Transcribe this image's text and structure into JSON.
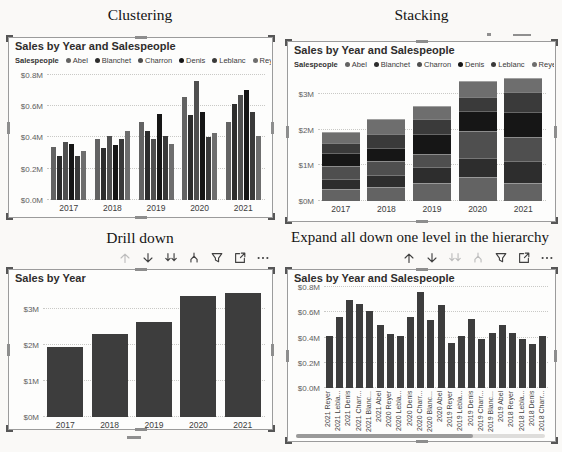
{
  "panels": {
    "clustering": {
      "heading": "Clustering",
      "visual_title": "Sales by Year and Salespeople",
      "legend_label": "Salespeople"
    },
    "stacking": {
      "heading": "Stacking",
      "visual_title": "Sales by Year and Salespeople",
      "legend_label": "Salespeople"
    },
    "drill": {
      "heading": "Drill down",
      "visual_title": "Sales by Year"
    },
    "expand": {
      "heading": "Expand all down one level in the hierarchy",
      "visual_title": "Sales by Year and Salespeople"
    }
  },
  "colors": {
    "bar_single": "#3d3d3d",
    "enabled_icon": "#404040",
    "disabled_icon": "#bdbdbd",
    "salespeople": {
      "Abel": "#636363",
      "Blanchet": "#2d2d2d",
      "Charron": "#4f4f4f",
      "Denis": "#161616",
      "Leblanc": "#3a3a3a",
      "Reyer": "#6e6e6e"
    }
  },
  "toolbars": {
    "drill": {
      "icons": [
        {
          "name": "drill-up",
          "enabled": false
        },
        {
          "name": "drill-down",
          "enabled": true
        },
        {
          "name": "go-to-next-level",
          "enabled": true
        },
        {
          "name": "expand-all-down",
          "enabled": true
        },
        {
          "name": "filter",
          "enabled": true
        },
        {
          "name": "focus-mode",
          "enabled": true
        },
        {
          "name": "more-options",
          "enabled": true
        }
      ]
    },
    "expand": {
      "icons": [
        {
          "name": "drill-up",
          "enabled": true
        },
        {
          "name": "drill-down",
          "enabled": true
        },
        {
          "name": "go-to-next-level",
          "enabled": false
        },
        {
          "name": "expand-all-down",
          "enabled": false
        },
        {
          "name": "filter",
          "enabled": true
        },
        {
          "name": "focus-mode",
          "enabled": true
        },
        {
          "name": "more-options",
          "enabled": true
        }
      ]
    }
  },
  "chart_data": [
    {
      "id": "clustering",
      "type": "bar",
      "subtype": "clustered",
      "title": "Sales by Year and Salespeople",
      "categories": [
        "2017",
        "2018",
        "2019",
        "2020",
        "2021"
      ],
      "series": [
        {
          "name": "Abel",
          "values": [
            0.34,
            0.39,
            0.5,
            0.66,
            0.5
          ]
        },
        {
          "name": "Blanchet",
          "values": [
            0.28,
            0.33,
            0.44,
            0.54,
            0.61
          ]
        },
        {
          "name": "Charron",
          "values": [
            0.37,
            0.41,
            0.39,
            0.76,
            0.67
          ]
        },
        {
          "name": "Denis",
          "values": [
            0.36,
            0.35,
            0.55,
            0.56,
            0.7
          ]
        },
        {
          "name": "Leblanc",
          "values": [
            0.28,
            0.39,
            0.41,
            0.4,
            0.56
          ]
        },
        {
          "name": "Reyer",
          "values": [
            0.31,
            0.44,
            0.36,
            0.43,
            0.41
          ]
        }
      ],
      "ytick_values": [
        0,
        0.2,
        0.4,
        0.6,
        0.8
      ],
      "ytick_labels": [
        "$0.0M",
        "$0.2M",
        "$0.4M",
        "$0.6M",
        "$0.8M"
      ],
      "ylim": [
        0,
        0.83
      ],
      "grid": true,
      "legend_position": "top"
    },
    {
      "id": "stacking",
      "type": "bar",
      "subtype": "stacked",
      "title": "Sales by Year and Salespeople",
      "categories": [
        "2017",
        "2018",
        "2019",
        "2020",
        "2021"
      ],
      "series": [
        {
          "name": "Abel",
          "values": [
            0.34,
            0.39,
            0.5,
            0.66,
            0.5
          ]
        },
        {
          "name": "Blanchet",
          "values": [
            0.28,
            0.33,
            0.44,
            0.54,
            0.61
          ]
        },
        {
          "name": "Charron",
          "values": [
            0.37,
            0.41,
            0.39,
            0.76,
            0.67
          ]
        },
        {
          "name": "Denis",
          "values": [
            0.36,
            0.35,
            0.55,
            0.56,
            0.7
          ]
        },
        {
          "name": "Leblanc",
          "values": [
            0.28,
            0.39,
            0.41,
            0.4,
            0.56
          ]
        },
        {
          "name": "Reyer",
          "values": [
            0.31,
            0.44,
            0.36,
            0.43,
            0.41
          ]
        }
      ],
      "totals": [
        1.94,
        2.31,
        2.65,
        3.35,
        3.45
      ],
      "ytick_values": [
        0,
        1,
        2,
        3
      ],
      "ytick_labels": [
        "$0M",
        "$1M",
        "$2M",
        "$3M"
      ],
      "ylim": [
        0,
        3.5
      ],
      "grid": true,
      "legend_position": "top"
    },
    {
      "id": "drill",
      "type": "bar",
      "subtype": "simple",
      "title": "Sales by Year",
      "categories": [
        "2017",
        "2018",
        "2019",
        "2020",
        "2021"
      ],
      "values": [
        1.94,
        2.31,
        2.65,
        3.35,
        3.45
      ],
      "ytick_values": [
        0,
        1,
        2,
        3
      ],
      "ytick_labels": [
        "$0M",
        "$1M",
        "$2M",
        "$3M"
      ],
      "ylim": [
        0,
        3.5
      ],
      "grid": true
    },
    {
      "id": "expand",
      "type": "bar",
      "subtype": "simple",
      "title": "Sales by Year and Salespeople",
      "categories": [
        "2021 Reyer",
        "2021 Lebla...",
        "2021 Denis",
        "2021 Charr...",
        "2021 Blanc...",
        "2021 Abel",
        "2020 Reyer",
        "2020 Lebla...",
        "2020 Denis",
        "2020 Charr...",
        "2020 Blanc...",
        "2020 Abel",
        "2019 Reyer",
        "2019 Lebla...",
        "2019 Denis",
        "2019 Charr...",
        "2019 Blanc...",
        "2019 Abel",
        "2018 Reyer",
        "2018 Lebla...",
        "2018 Denis",
        "2018 Charr..."
      ],
      "values": [
        0.41,
        0.56,
        0.7,
        0.67,
        0.61,
        0.5,
        0.43,
        0.41,
        0.56,
        0.76,
        0.54,
        0.66,
        0.36,
        0.41,
        0.55,
        0.39,
        0.44,
        0.5,
        0.44,
        0.39,
        0.35,
        0.41
      ],
      "ytick_values": [
        0,
        0.2,
        0.4,
        0.6,
        0.8
      ],
      "ytick_labels": [
        "$0.0M",
        "$0.2M",
        "$0.4M",
        "$0.6M",
        "$0.8M"
      ],
      "ylim": [
        0,
        0.81
      ],
      "grid": true,
      "x_labels_rotated": true,
      "has_horizontal_scrollbar": true
    }
  ]
}
